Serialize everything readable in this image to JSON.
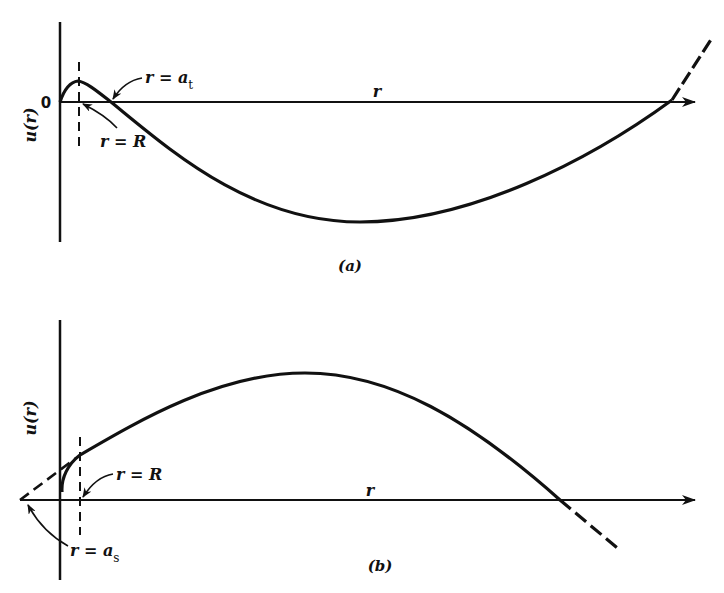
{
  "figure": {
    "panel_a": {
      "caption": "(a)",
      "y_axis_label": "u(r)",
      "x_axis_label": "r",
      "origin_label": "0",
      "annotations": {
        "at": "r = a",
        "at_sub": "t",
        "R": "r = R"
      }
    },
    "panel_b": {
      "caption": "(b)",
      "y_axis_label": "u(r)",
      "x_axis_label": "r",
      "annotations": {
        "R": "r = R",
        "as": "r = a",
        "as_sub": "s"
      }
    },
    "colors": {
      "ink": "#111111",
      "background": "#ffffff"
    }
  }
}
